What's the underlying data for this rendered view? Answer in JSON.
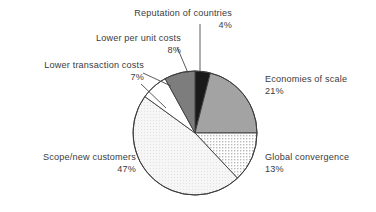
{
  "chart_data": {
    "type": "pie",
    "title": "",
    "subtitle": "",
    "xlabel": "",
    "ylabel": "",
    "legend_position": "none",
    "grid": false,
    "value_unit": "%",
    "start_angle_deg": 0,
    "direction": "clockwise",
    "categories": [
      "Reputation of countries",
      "Economies of scale",
      "Global convergence",
      "Scope/new customers",
      "Lower transaction costs",
      "Lower per unit costs"
    ],
    "values": [
      4,
      21,
      13,
      47,
      7,
      8
    ],
    "total": 100,
    "slices": [
      {
        "label": "Reputation of countries",
        "value": 4,
        "value_text": "4%",
        "fill": "#1a1a1a",
        "pattern": "solid",
        "label_position": "top",
        "leader_line": true
      },
      {
        "label": "Economies of scale",
        "value": 21,
        "value_text": "21%",
        "fill": "#a3a3a3",
        "pattern": "solid",
        "label_position": "right",
        "leader_line": false
      },
      {
        "label": "Global convergence",
        "value": 13,
        "value_text": "13%",
        "fill": "#ffffff",
        "pattern": "dots-medium",
        "label_position": "right",
        "leader_line": false
      },
      {
        "label": "Scope/new customers",
        "value": 47,
        "value_text": "47%",
        "fill": "#f4f4f4",
        "pattern": "dots-fine",
        "label_position": "left",
        "leader_line": false
      },
      {
        "label": "Lower transaction costs",
        "value": 7,
        "value_text": "7%",
        "fill": "#ffffff",
        "pattern": "solid",
        "label_position": "left",
        "leader_line": true
      },
      {
        "label": "Lower per unit costs",
        "value": 8,
        "value_text": "8%",
        "fill": "#7d7d7d",
        "pattern": "solid",
        "label_position": "top-left",
        "leader_line": true
      }
    ],
    "colors": {
      "background": "#ffffff",
      "outline": "#3c3c3c",
      "text": "#3b3b3b",
      "leader_line": "#4a4a4a"
    },
    "geometry": {
      "center_x": 195,
      "center_y": 133,
      "radius": 62
    }
  },
  "labels": {
    "reputation": {
      "name": "Reputation of countries",
      "pct": "4%"
    },
    "lower_per_unit": {
      "name": "Lower per unit costs",
      "pct": "8%"
    },
    "lower_transaction": {
      "name": "Lower transaction costs",
      "pct": "7%"
    },
    "scope": {
      "name": "Scope/new customers",
      "pct": "47%"
    },
    "economies": {
      "name": "Economies of scale",
      "pct": "21%"
    },
    "global_convergence": {
      "name": "Global convergence",
      "pct": "13%"
    }
  }
}
